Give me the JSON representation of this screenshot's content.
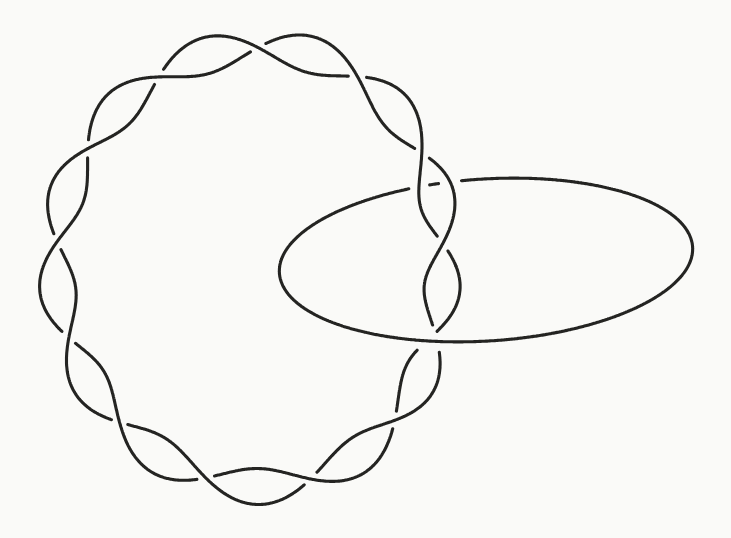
{
  "canvas": {
    "width": 731,
    "height": 538,
    "background": "#fafaf8"
  },
  "figure": {
    "description_colors": {
      "ink": "#242422"
    },
    "style": {
      "stroke": "#242422",
      "strokeWidth": 3.1,
      "lineCap": "round"
    },
    "loop": {
      "cx": 258,
      "cy": 266,
      "r0": 206.5,
      "c1": -5.5,
      "c2": -13.0,
      "wobble": 3.0,
      "wobblePhase": -160,
      "amp": 18,
      "freq": 6.5,
      "phase": 45,
      "crossings": 13,
      "samples": 1600
    },
    "ring": {
      "cx": 486,
      "cy": 260,
      "rx": 207,
      "ry": 81,
      "rotation": -3.6,
      "samples": 1000
    },
    "gaps": {
      "band": 8.5,
      "ring": 10
    }
  }
}
